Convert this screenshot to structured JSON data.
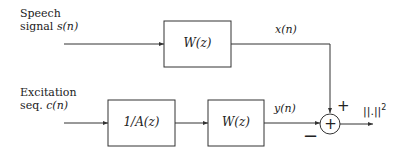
{
  "diagram": {
    "inputs": {
      "speech": {
        "line1": "Speech",
        "line2_prefix": "signal ",
        "line2_math": "s(n)"
      },
      "excitation": {
        "line1": "Excitation",
        "line2_prefix": "seq. ",
        "line2_math": "c(n)"
      }
    },
    "blocks": {
      "top_filter": "W(z)",
      "synthesis_filter": "1/A(z)",
      "bottom_filter": "W(z)"
    },
    "signals": {
      "x": "x(n)",
      "y": "y(n)"
    },
    "summer": {
      "plus_sign": "+",
      "minus_sign": "−",
      "symbol": "+"
    },
    "output": {
      "label": "||.||",
      "exponent": "2"
    }
  }
}
